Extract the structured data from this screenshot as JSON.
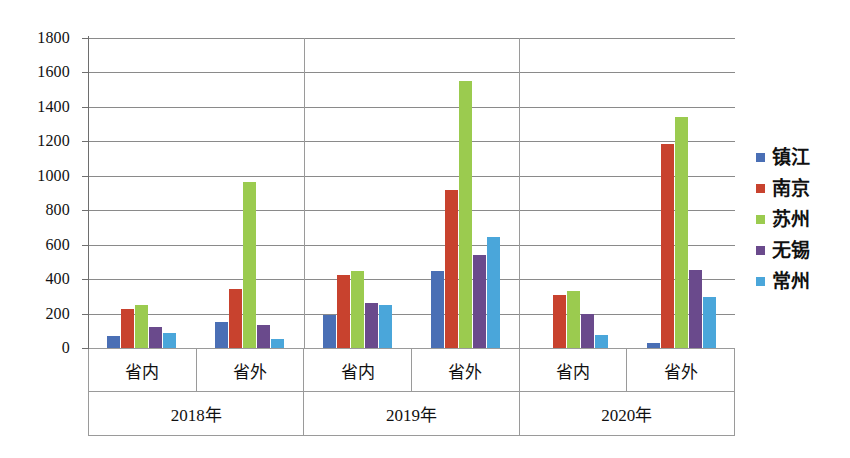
{
  "chart_data": {
    "type": "bar",
    "title": "",
    "subtitle": "",
    "xlabel": "",
    "ylabel": "",
    "ylim": [
      0,
      1800
    ],
    "ytick_step": 200,
    "yticks": [
      0,
      200,
      400,
      600,
      800,
      1000,
      1200,
      1400,
      1600,
      1800
    ],
    "ytick_labels": [
      "0",
      "200",
      "400",
      "600",
      "800",
      "1000",
      "1200",
      "1400",
      "1600",
      "1800"
    ],
    "grid": true,
    "legend_position": "right",
    "years": [
      "2018年",
      "2019年",
      "2020年"
    ],
    "subcategories": [
      "省内",
      "省外"
    ],
    "categories": [
      "2018年 省内",
      "2018年 省外",
      "2019年 省内",
      "2019年 省外",
      "2020年 省内",
      "2020年 省外"
    ],
    "series": [
      {
        "name": "镇江",
        "color": "#4A6FB5",
        "values": [
          70,
          150,
          190,
          445,
          0,
          30
        ]
      },
      {
        "name": "南京",
        "color": "#C8422E",
        "values": [
          225,
          340,
          425,
          915,
          310,
          1185
        ]
      },
      {
        "name": "苏州",
        "color": "#9BCB4F",
        "values": [
          250,
          965,
          445,
          1550,
          330,
          1340
        ]
      },
      {
        "name": "无锡",
        "color": "#6A4A8C",
        "values": [
          120,
          135,
          260,
          540,
          195,
          455
        ]
      },
      {
        "name": "常州",
        "color": "#4AA6DA",
        "values": [
          90,
          50,
          250,
          645,
          75,
          295
        ]
      }
    ]
  },
  "legend": {
    "items": [
      {
        "label": "镇江",
        "color": "#4A6FB5"
      },
      {
        "label": "南京",
        "color": "#C8422E"
      },
      {
        "label": "苏州",
        "color": "#9BCB4F"
      },
      {
        "label": "无锡",
        "color": "#6A4A8C"
      },
      {
        "label": "常州",
        "color": "#4AA6DA"
      }
    ]
  }
}
